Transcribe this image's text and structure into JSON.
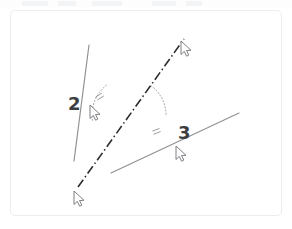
{
  "page": {
    "background": "#ffffff",
    "card": {
      "border_color": "#eceded",
      "fill": "#ffffff"
    }
  },
  "top_strip": {
    "visible": true,
    "fill": "#fdfdfe",
    "chips": [
      {
        "left": 22,
        "width": 26
      },
      {
        "left": 58,
        "width": 18
      },
      {
        "left": 92,
        "width": 30
      },
      {
        "left": 152,
        "width": 24
      },
      {
        "left": 186,
        "width": 16
      }
    ]
  },
  "chart_data": {
    "type": "diagram",
    "title": "",
    "subtitle": "",
    "labels": [
      {
        "id": "label-2",
        "text": "2",
        "x": 57,
        "y": 84,
        "color": "#3b3d40",
        "font_size": 18,
        "bold": true
      },
      {
        "id": "label-3",
        "text": "3",
        "x": 167,
        "y": 113,
        "color": "#3b3d40",
        "font_size": 18,
        "bold": true
      }
    ],
    "lines": [
      {
        "id": "line-2",
        "name": "gray-line-2",
        "style": "solid",
        "color": "#8f9295",
        "width": 1.2,
        "x1": 78,
        "y1": 34,
        "x2": 63,
        "y2": 150
      },
      {
        "id": "line-3",
        "name": "gray-line-3",
        "style": "solid",
        "color": "#8f9295",
        "width": 1.2,
        "x1": 100,
        "y1": 162,
        "x2": 228,
        "y2": 102
      },
      {
        "id": "transversal",
        "name": "dash-dot-transversal",
        "style": "dash-dot",
        "color": "#2b2d30",
        "width": 1.6,
        "dash_pattern": "9 3 1.5 3",
        "x1": 67,
        "y1": 176,
        "x2": 173,
        "y2": 28
      }
    ],
    "vertex": {
      "x": 119,
      "y": 104
    },
    "arcs": [
      {
        "id": "arc-1",
        "name": "angle-arc-upper-left",
        "color": "#9a9da0",
        "style": "dotted",
        "radius": 38,
        "start_angle_deg": 172,
        "end_angle_deg": 234,
        "tick_count": 2
      },
      {
        "id": "arc-2",
        "name": "angle-arc-lower-right",
        "color": "#9a9da0",
        "style": "dotted",
        "radius": 36,
        "start_angle_deg": 306,
        "end_angle_deg": 360,
        "tick_count": 2
      }
    ],
    "cursors": [
      {
        "id": "cursor-line2",
        "name": "cursor-on-line-2",
        "x": 79,
        "y": 94,
        "color": "#6e7174"
      },
      {
        "id": "cursor-transversal-top",
        "name": "cursor-on-transversal-top",
        "x": 170,
        "y": 30,
        "color": "#6e7174"
      },
      {
        "id": "cursor-transversal-bottom",
        "name": "cursor-on-transversal-bottom",
        "x": 63,
        "y": 180,
        "color": "#6e7174"
      },
      {
        "id": "cursor-line3",
        "name": "cursor-on-line-3",
        "x": 165,
        "y": 135,
        "color": "#6e7174"
      }
    ]
  }
}
